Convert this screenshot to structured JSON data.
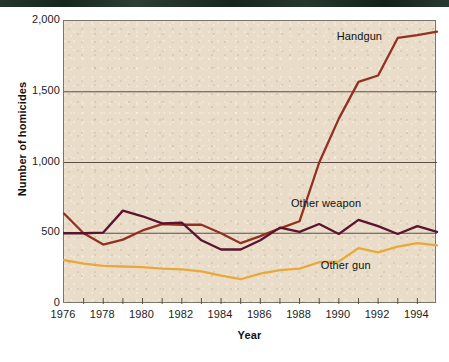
{
  "figure": {
    "background_color": "#ffffff",
    "plot_background_color": "#e9ddc9",
    "top_band_color": "#1e3229",
    "frame_color": "#7d7468"
  },
  "chart_data": {
    "type": "line",
    "title": "",
    "xlabel": "Year",
    "ylabel": "Number of homicides",
    "xlim": [
      1976,
      1995
    ],
    "ylim": [
      0,
      2000
    ],
    "grid": true,
    "gridlines_y": [
      500,
      1000,
      1500,
      2000
    ],
    "legend_position": "inline-annotations",
    "y_tick_labels": [
      "2,000",
      "1,500",
      "1,000",
      "500",
      "0"
    ],
    "y_tick_values": [
      2000,
      1500,
      1000,
      500,
      0
    ],
    "x_tick_labels": [
      "1976",
      "1978",
      "1980",
      "1982",
      "1984",
      "1986",
      "1988",
      "1990",
      "1992",
      "1994"
    ],
    "x_tick_values": [
      1976,
      1978,
      1980,
      1982,
      1984,
      1986,
      1988,
      1990,
      1992,
      1994
    ],
    "x_minor_ticks": [
      1977,
      1979,
      1981,
      1983,
      1985,
      1987,
      1989,
      1991,
      1993,
      1995
    ],
    "x": [
      1976,
      1977,
      1978,
      1979,
      1980,
      1981,
      1982,
      1983,
      1984,
      1985,
      1986,
      1987,
      1988,
      1989,
      1990,
      1991,
      1992,
      1993,
      1994,
      1995
    ],
    "series": [
      {
        "name": "Handgun",
        "color": "#93301f",
        "label_x": 1991.1,
        "label_y": 1880,
        "values": [
          640,
          500,
          420,
          455,
          520,
          565,
          560,
          560,
          500,
          430,
          480,
          535,
          585,
          1000,
          1310,
          1570,
          1615,
          1880,
          1900,
          1925
        ]
      },
      {
        "name": "Other weapon",
        "color": "#5b1430",
        "label_x": 1989.4,
        "label_y": 700,
        "values": [
          500,
          500,
          505,
          660,
          620,
          570,
          575,
          450,
          385,
          385,
          450,
          540,
          510,
          565,
          495,
          595,
          550,
          495,
          550,
          510
        ]
      },
      {
        "name": "Other gun",
        "color": "#e9a93a",
        "label_x": 1990.4,
        "label_y": 260,
        "values": [
          310,
          285,
          270,
          265,
          260,
          250,
          245,
          230,
          200,
          175,
          215,
          240,
          250,
          295,
          300,
          395,
          365,
          405,
          430,
          415
        ]
      }
    ]
  }
}
